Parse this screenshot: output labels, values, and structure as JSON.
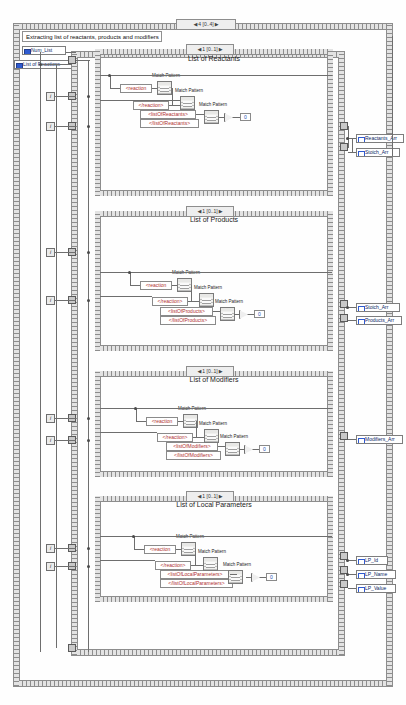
{
  "diagram": {
    "type": "labview-block-diagram",
    "title_comment": "Extracting list of reactants, products and modifiers",
    "outer_structure": {
      "name": "outer-for-loop",
      "frame_selector": "4 [0..4]",
      "left_arrow": "◀",
      "right_arrow": "▶"
    },
    "inputs": [
      {
        "label": "Num_List",
        "name": "num-list-control"
      },
      {
        "label": "List of Reactions",
        "name": "list-of-reactions-control"
      }
    ],
    "frames": [
      {
        "index": 0,
        "title": "List of Reactants",
        "selector": "1 [0..1]",
        "constants": [
          "<reaction",
          "</reaction>",
          "<listOfReactants>",
          "</listOfReactants>"
        ],
        "functions": [
          "Match Pattern",
          "Match Pattern",
          "Match Pattern"
        ],
        "numeric_constant": "0",
        "outputs": [
          "Reactants_Arr",
          "Stoich_Arr"
        ]
      },
      {
        "index": 1,
        "title": "List of Products",
        "selector": "1 [0..1]",
        "constants": [
          "<reaction",
          "</reaction>",
          "<listOfProducts>",
          "</listOfProducts>"
        ],
        "functions": [
          "Match Pattern",
          "Match Pattern",
          "Match Pattern"
        ],
        "numeric_constant": "0",
        "outputs": [
          "Stoich_Arr",
          "Products_Arr"
        ]
      },
      {
        "index": 2,
        "title": "List of Modifiers",
        "selector": "1 [0..1]",
        "constants": [
          "<reaction",
          "</reaction>",
          "<listOfModifiers>",
          "</listOfModifiers>"
        ],
        "functions": [
          "Match Pattern",
          "Match Pattern",
          "Match Pattern"
        ],
        "numeric_constant": "0",
        "outputs": [
          "Modifiers_Arr"
        ]
      },
      {
        "index": 3,
        "title": "List of Local Parameters",
        "selector": "1 [0..1]",
        "constants": [
          "<reaction",
          "</reaction>",
          "<listOfLocalParameters>",
          "</listOfLocalParameters>"
        ],
        "functions": [
          "Match Pattern",
          "Match Pattern",
          "Match Pattern"
        ],
        "numeric_constant": "0",
        "outputs": [
          "LP_Id",
          "LP_Name",
          "LP_Value"
        ]
      }
    ],
    "iteration_terminal": "i",
    "colors": {
      "string_constant": "#b03030",
      "numeric_constant": "#1a4fb5",
      "terminal_label": "#0b1f66",
      "wire": "#6e6e6e",
      "structure_border": "#cfcfcf",
      "background": "#fefefe"
    }
  }
}
